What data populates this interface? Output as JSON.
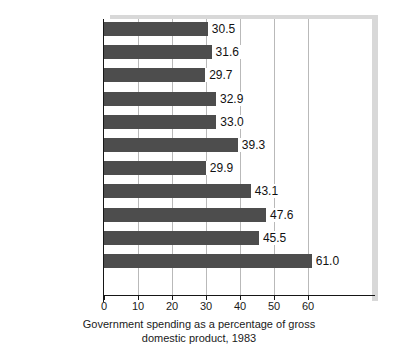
{
  "chart_data": {
    "type": "bar",
    "orientation": "horizontal",
    "title": "",
    "caption_line_1": "Government spending as a percentage of gross",
    "caption_line_2": "domestic product, 1983",
    "xlabel": "",
    "ylabel": "",
    "xlim": [
      0,
      70
    ],
    "xticks": [
      "0",
      "10",
      "20",
      "30",
      "40",
      "50",
      "60"
    ],
    "xtick_values": [
      0,
      10,
      20,
      30,
      40,
      50,
      60
    ],
    "grid": "vertical",
    "legend": "none",
    "bar_color": "#4d4d4d",
    "categories": [
      "Spain",
      "Japan",
      "Greece",
      "Australia",
      "United States",
      "Canada",
      "Switzerland",
      "United Kingdom",
      "West Germany",
      "France",
      "Sweden"
    ],
    "values": [
      30.5,
      31.6,
      29.7,
      32.9,
      33.0,
      39.3,
      29.9,
      43.1,
      47.6,
      45.5,
      61.0
    ],
    "value_labels": [
      "30.5",
      "31.6",
      "29.7",
      "32.9",
      "33.0",
      "39.3",
      "29.9",
      "43.1",
      "47.6",
      "45.5",
      "61.0"
    ]
  }
}
